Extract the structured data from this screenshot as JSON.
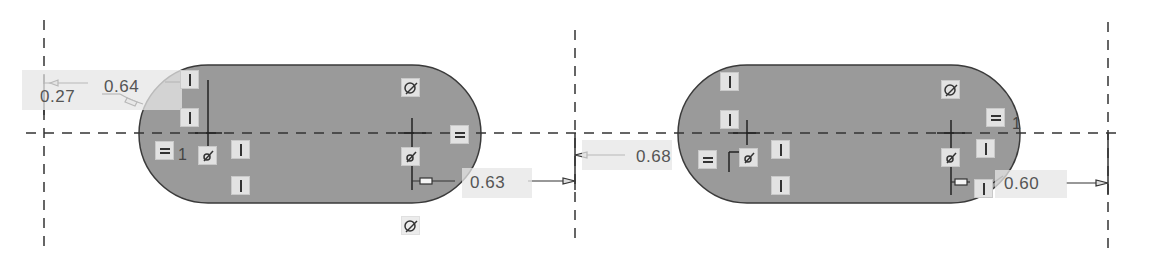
{
  "sketch": {
    "background": "#ffffff",
    "fill_color": "#9a9a9a",
    "outline_color": "#3a3a3a",
    "centerline_color": "#333333",
    "badge_color": "#e2e2e2",
    "slots": [
      {
        "name": "slot-left",
        "left": 139,
        "right": 482,
        "top": 65,
        "bottom": 203,
        "center_marks": [
          208,
          412
        ]
      },
      {
        "name": "slot-right",
        "left": 679,
        "right": 1020,
        "top": 65,
        "bottom": 203,
        "center_marks": [
          747,
          951
        ]
      }
    ],
    "vertical_centerlines": [
      44,
      575,
      1108
    ],
    "horizontal_centerline_y": 133
  },
  "dimensions": {
    "d1": "0.27",
    "d2": "0.64",
    "d3": "0.63",
    "d4": "0.68",
    "d5": "0.60"
  },
  "labels": {
    "eq_index_left": "1",
    "eq_index_right": "1"
  },
  "constraints": {
    "vertical": "vertical-constraint",
    "equal": "equal-constraint",
    "coincident": "coincident-constraint",
    "tangent": "tangent-constraint"
  }
}
